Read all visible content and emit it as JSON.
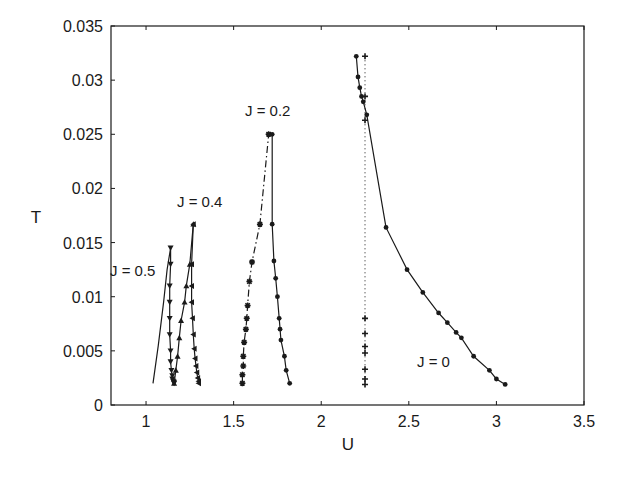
{
  "chart_data": {
    "type": "line",
    "title": "",
    "xlabel": "U",
    "ylabel": "T",
    "xlim": [
      0.8,
      3.5
    ],
    "ylim": [
      0,
      0.035
    ],
    "xticks": [
      1,
      1.5,
      2,
      2.5,
      3,
      3.5
    ],
    "xtick_labels": [
      "1",
      "1.5",
      "2",
      "2.5",
      "3",
      "3.5"
    ],
    "yticks": [
      0,
      0.005,
      0.01,
      0.015,
      0.02,
      0.025,
      0.03,
      0.035
    ],
    "ytick_labels": [
      "0",
      "0.005",
      "0.01",
      "0.015",
      "0.02",
      "0.025",
      "0.03",
      "0.035"
    ],
    "grid": false,
    "legend": "none (inline labels)",
    "series": [
      {
        "name": "J=0.5 (left branch)",
        "label": "J=0.5",
        "style": "solid",
        "marker": "none",
        "x": [
          1.04,
          1.07,
          1.1,
          1.12,
          1.14
        ],
        "y": [
          0.002,
          0.0055,
          0.0095,
          0.0125,
          0.0145
        ]
      },
      {
        "name": "J=0.5 (right branch)",
        "style": "solid",
        "marker": "inverted-triangle",
        "x": [
          1.14,
          1.14,
          1.135,
          1.135,
          1.135,
          1.135,
          1.14,
          1.14,
          1.145,
          1.15,
          1.15,
          1.155,
          1.16,
          1.16
        ],
        "y": [
          0.0145,
          0.013,
          0.011,
          0.0095,
          0.008,
          0.0065,
          0.005,
          0.004,
          0.0032,
          0.0027,
          0.0024,
          0.0022,
          0.0021,
          0.002
        ]
      },
      {
        "name": "J=0.4 (left branch)",
        "label": "J=0.4",
        "style": "solid",
        "marker": "triangle",
        "x": [
          1.16,
          1.17,
          1.18,
          1.19,
          1.2,
          1.22,
          1.23,
          1.25,
          1.27
        ],
        "y": [
          0.002,
          0.0032,
          0.0045,
          0.0062,
          0.0078,
          0.0095,
          0.011,
          0.013,
          0.0167
        ]
      },
      {
        "name": "J=0.4 (right branch)",
        "style": "solid",
        "marker": "left-triangle",
        "x": [
          1.27,
          1.26,
          1.26,
          1.26,
          1.265,
          1.27,
          1.275,
          1.28,
          1.285,
          1.29,
          1.295,
          1.3,
          1.3
        ],
        "y": [
          0.0167,
          0.013,
          0.011,
          0.0095,
          0.008,
          0.0065,
          0.0052,
          0.0043,
          0.0036,
          0.003,
          0.0025,
          0.0022,
          0.002
        ]
      },
      {
        "name": "J=0.2 (left branch)",
        "label": "J=0.2",
        "style": "dash-dot",
        "marker": "asterisk",
        "x": [
          1.55,
          1.55,
          1.555,
          1.555,
          1.56,
          1.57,
          1.575,
          1.58,
          1.59,
          1.605,
          1.65,
          1.7
        ],
        "y": [
          0.002,
          0.0028,
          0.0036,
          0.0045,
          0.0058,
          0.007,
          0.008,
          0.0092,
          0.0114,
          0.0132,
          0.0167,
          0.025
        ]
      },
      {
        "name": "J=0.2 (right branch)",
        "style": "solid",
        "marker": "dot",
        "x": [
          1.7,
          1.72,
          1.72,
          1.73,
          1.74,
          1.75,
          1.76,
          1.765,
          1.77,
          1.79,
          1.8,
          1.82
        ],
        "y": [
          0.025,
          0.025,
          0.0167,
          0.0133,
          0.0117,
          0.01,
          0.008,
          0.007,
          0.006,
          0.0045,
          0.0032,
          0.002
        ]
      },
      {
        "name": "J=0 (metastable boundary)",
        "label": "J=0",
        "style": "solid",
        "marker": "dot",
        "x": [
          2.2,
          2.21,
          2.22,
          2.23,
          2.24,
          2.26,
          2.37,
          2.49,
          2.58,
          2.67,
          2.72,
          2.77,
          2.8,
          2.87,
          2.96,
          3.0,
          3.05
        ],
        "y": [
          0.0322,
          0.0303,
          0.0293,
          0.0285,
          0.028,
          0.0268,
          0.0164,
          0.0125,
          0.0104,
          0.0085,
          0.0076,
          0.0067,
          0.0062,
          0.0045,
          0.0032,
          0.0024,
          0.0019
        ]
      },
      {
        "name": "J=0 (vertical dotted line)",
        "style": "dotted",
        "marker": "plus",
        "x": [
          2.25,
          2.25,
          2.25,
          2.25,
          2.25,
          2.25,
          2.25,
          2.25,
          2.25,
          2.25
        ],
        "y": [
          0.0322,
          0.0285,
          0.0263,
          0.008,
          0.0066,
          0.0054,
          0.0048,
          0.0033,
          0.0024,
          0.0019
        ]
      }
    ],
    "annotations": [
      {
        "text": "J = 0.5",
        "x": 0.85,
        "y": 0.0123
      },
      {
        "text": "J = 0.4",
        "x": 1.13,
        "y": 0.0185
      },
      {
        "text": "J = 0.2",
        "x": 1.54,
        "y": 0.0247
      },
      {
        "text": "J = 0",
        "x": 2.55,
        "y": 0.0036
      }
    ]
  },
  "labels": {
    "xlabel": "U",
    "ylabel": "T",
    "j05": "J = 0.5",
    "j04": "J = 0.4",
    "j02": "J = 0.2",
    "j0": "J = 0"
  },
  "colors": {
    "ink": "#1a1a1a",
    "background": "#ffffff"
  }
}
